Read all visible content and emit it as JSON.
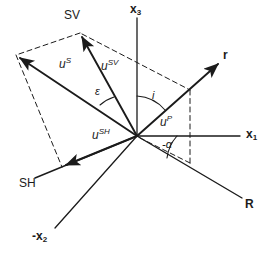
{
  "figure": {
    "background": "#ffffff",
    "stroke": "#1b1b1b"
  },
  "axes": [
    {
      "key": "x3",
      "label": "x",
      "sub": "3",
      "name": "axis-x3",
      "x": 131,
      "y": 4,
      "desc": "vertical axis upward"
    },
    {
      "key": "x1",
      "label": "x",
      "sub": "1",
      "name": "axis-x1",
      "x": 246,
      "y": 128,
      "desc": "horizontal axis right"
    },
    {
      "key": "-x2",
      "label": "-x",
      "sub": "2",
      "name": "axis-neg-x2",
      "x": 34,
      "y": 231,
      "desc": "axis lower-left"
    }
  ],
  "rays": [
    {
      "key": "r",
      "label": "r",
      "name": "ray-r",
      "x": 224,
      "y": 50,
      "desc": "incident ray direction upper right"
    },
    {
      "key": "R",
      "label": "R",
      "name": "ray-R",
      "x": 246,
      "y": 199,
      "desc": "ray continuation lower right"
    }
  ],
  "modes": [
    {
      "key": "SV",
      "label": "SV",
      "name": "mode-sv",
      "x": 65,
      "y": 10,
      "desc": "SV polarization direction upper left"
    },
    {
      "key": "SH",
      "label": "SH",
      "name": "mode-sh",
      "x": 20,
      "y": 178,
      "desc": "SH polarization direction lower left"
    }
  ],
  "vectors": [
    {
      "key": "uS",
      "base": "u",
      "sup": "S",
      "name": "vector-u-s",
      "x": 60,
      "y": 58,
      "desc": "total S displacement vector"
    },
    {
      "key": "uSV",
      "base": "u",
      "sup": "SV",
      "name": "vector-u-sv",
      "x": 102,
      "y": 60,
      "desc": "SV component of displacement"
    },
    {
      "key": "uSH",
      "base": "u",
      "sup": "SH",
      "name": "vector-u-sh",
      "x": 93,
      "y": 130,
      "desc": "SH component of displacement"
    },
    {
      "key": "uP",
      "base": "u",
      "sup": "P",
      "name": "vector-u-p",
      "x": 161,
      "y": 117,
      "desc": "P displacement along ray r"
    }
  ],
  "angles": [
    {
      "key": "epsilon",
      "label": "ε",
      "name": "angle-epsilon",
      "x": 95,
      "y": 88,
      "desc": "angle between u-S and u-SV"
    },
    {
      "key": "i",
      "label": "i",
      "name": "angle-i",
      "x": 152,
      "y": 92,
      "desc": "incidence angle from x3 axis to ray r"
    },
    {
      "key": "-alpha",
      "label": "-α",
      "name": "angle-neg-alpha",
      "x": 163,
      "y": 140,
      "desc": "azimuth angle below x1 axis"
    }
  ],
  "geometry": {
    "origin": {
      "x": 137,
      "y": 136
    },
    "solid_lines": [
      {
        "name": "axis-x3-line",
        "x1": 137,
        "y1": 136,
        "x2": 137,
        "y2": 18,
        "arrow": false
      },
      {
        "name": "axis-x1-line",
        "x1": 137,
        "y1": 136,
        "x2": 239,
        "y2": 136,
        "arrow": false
      },
      {
        "name": "axis-neg-x2-line",
        "x1": 137,
        "y1": 136,
        "x2": 55,
        "y2": 228,
        "arrow": false
      },
      {
        "name": "ray-r-line",
        "x1": 137,
        "y1": 136,
        "x2": 221,
        "y2": 61,
        "arrow": true
      },
      {
        "name": "ray-R-line",
        "x1": 137,
        "y1": 136,
        "x2": 241,
        "y2": 198,
        "arrow": false
      },
      {
        "name": "vector-u-sv-line",
        "x1": 137,
        "y1": 136,
        "x2": 80,
        "y2": 33,
        "arrow": true
      },
      {
        "name": "vector-u-s-line",
        "x1": 137,
        "y1": 136,
        "x2": 16,
        "y2": 55,
        "arrow": true
      },
      {
        "name": "vector-u-sh-line",
        "x1": 137,
        "y1": 136,
        "x2": 62,
        "y2": 167,
        "arrow": true
      },
      {
        "name": "mode-sh-axis-line",
        "x1": 137,
        "y1": 136,
        "x2": 36,
        "y2": 178,
        "arrow": false
      }
    ],
    "dashed_lines": [
      {
        "name": "parallelogram-top-edge",
        "x1": 80,
        "y1": 33,
        "x2": 16,
        "y2": 55
      },
      {
        "name": "parallelogram-left-edge",
        "x1": 16,
        "y1": 55,
        "x2": 62,
        "y2": 167
      },
      {
        "name": "sv-to-ray-dashed",
        "x1": 80,
        "y1": 33,
        "x2": 190,
        "y2": 90
      },
      {
        "name": "ray-projection-vertical",
        "x1": 190,
        "y1": 90,
        "x2": 190,
        "y2": 163
      },
      {
        "name": "ray-projection-to-origin-plane",
        "x1": 190,
        "y1": 163,
        "x2": 137,
        "y2": 136
      }
    ]
  }
}
